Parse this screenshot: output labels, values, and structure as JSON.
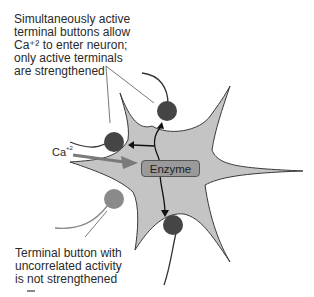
{
  "diagram": {
    "type": "neuron-synaptic-strengthening",
    "labels": {
      "top": "Simultaneously active\nterminal buttons allow\nCa⁺² to enter neuron;\nonly active terminals\nare strengthened",
      "bottom": "Terminal button with\nuncorrelated activity\nis not strengthened",
      "ion": "Ca",
      "ion_charge": "+2",
      "enzyme": "Enzyme"
    },
    "colors": {
      "neuron_fill": "#c4c4c4",
      "neuron_outline": "#3a3a3a",
      "active_terminal": "#454545",
      "inactive_terminal": "#8a8a8a",
      "enzyme_fill": "#9a9a9a",
      "ca_arrow": "#7a7a7a",
      "signal_arrow": "#111111"
    },
    "terminals": [
      {
        "id": "top",
        "state": "active"
      },
      {
        "id": "left",
        "state": "active"
      },
      {
        "id": "bottom",
        "state": "active"
      },
      {
        "id": "lower-left",
        "state": "uncorrelated"
      }
    ]
  }
}
